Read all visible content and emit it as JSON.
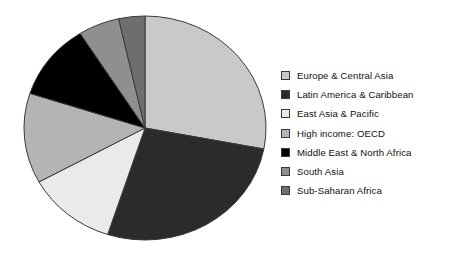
{
  "chart_data": {
    "type": "pie",
    "title": "",
    "subtitle": "",
    "xlabel": "",
    "ylabel": "",
    "grid": false,
    "legend_position": "right",
    "start_angle_deg": 0,
    "direction": "clockwise",
    "categories": [
      "Europe & Central Asia",
      "Latin America & Caribbean",
      "East Asia & Pacific",
      "High income: OECD",
      "Middle East & North Africa",
      "South Asia",
      "Sub-Saharan Africa"
    ],
    "values": [
      28.0,
      27.0,
      12.0,
      13.0,
      11.0,
      5.5,
      3.5
    ],
    "colors": [
      "#c9c9c9",
      "#2b2b2b",
      "#eaeaea",
      "#b4b4b4",
      "#000000",
      "#8f8f8f",
      "#6e6e6e"
    ],
    "slice_edge_color": "#3a3a3a"
  },
  "legend": {
    "items": [
      {
        "label": "Europe & Central Asia",
        "color": "#c9c9c9"
      },
      {
        "label": "Latin America & Caribbean",
        "color": "#2b2b2b"
      },
      {
        "label": "East Asia & Pacific",
        "color": "#eaeaea"
      },
      {
        "label": "High income: OECD",
        "color": "#b4b4b4"
      },
      {
        "label": "Middle East & North Africa",
        "color": "#000000"
      },
      {
        "label": "South Asia",
        "color": "#8f8f8f"
      },
      {
        "label": "Sub-Saharan Africa",
        "color": "#6e6e6e"
      }
    ]
  }
}
